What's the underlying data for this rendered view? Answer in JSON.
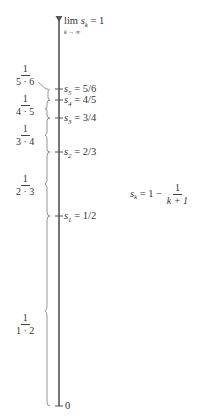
{
  "limit_label": {
    "prefix": "lim",
    "var": "s",
    "sub": "k",
    "eq": " = 1",
    "under": "k → ∞"
  },
  "partial_sums": [
    {
      "name": "s",
      "sub": "5",
      "value": " = 5/6",
      "y": 89
    },
    {
      "name": "s",
      "sub": "4",
      "value": " = 4/5",
      "y": 100
    },
    {
      "name": "s",
      "sub": "3",
      "value": " = 3/4",
      "y": 118
    },
    {
      "name": "s",
      "sub": "2",
      "value": " = 2/3",
      "y": 152
    },
    {
      "name": "s",
      "sub": "1",
      "value": " = 1/2",
      "y": 216
    }
  ],
  "zero_label": "0",
  "terms": [
    {
      "num": "1",
      "den": "5 · 6",
      "y": 70
    },
    {
      "num": "1",
      "den": "4 · 5",
      "y": 100
    },
    {
      "num": "1",
      "den": "3 · 4",
      "y": 126
    },
    {
      "num": "1",
      "den": "2 · 3",
      "y": 175
    },
    {
      "num": "1",
      "den": "1 · 2",
      "y": 315
    }
  ],
  "formula": {
    "lhs_var": "s",
    "lhs_sub": "k",
    "rhs_prefix": " = 1 − ",
    "num": "1",
    "den": "k + 1"
  },
  "colors": {
    "axis": "#555555",
    "brace": "#888888",
    "text": "#333333"
  }
}
